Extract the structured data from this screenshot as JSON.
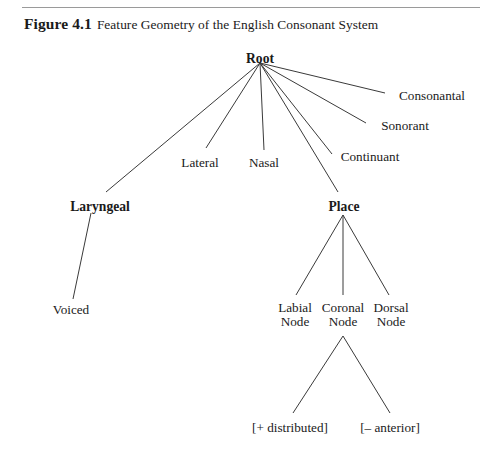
{
  "caption": {
    "figure_label": "Figure 4.1",
    "title": "Feature Geometry of the English Consonant System"
  },
  "chart_data": {
    "type": "diagram",
    "diagram_kind": "feature-geometry-tree",
    "title": "Feature Geometry of the English Consonant System",
    "root": "Root",
    "nodes": [
      {
        "id": "root",
        "label": "Root",
        "bold": true,
        "x": 260,
        "y": 52,
        "anchor_x": 260,
        "anchor_y": 63,
        "lines": [
          "Root"
        ]
      },
      {
        "id": "consonantal",
        "label": "Consonantal",
        "bold": false,
        "x": 432,
        "y": 89,
        "anchor_x": 385,
        "anchor_y": 93,
        "lines": [
          "Consonantal"
        ]
      },
      {
        "id": "sonorant",
        "label": "Sonorant",
        "bold": false,
        "x": 405,
        "y": 119,
        "anchor_x": 366,
        "anchor_y": 123,
        "lines": [
          "Sonorant"
        ]
      },
      {
        "id": "continuant",
        "label": "Continuant",
        "bold": false,
        "x": 370,
        "y": 150,
        "anchor_x": 332,
        "anchor_y": 154,
        "lines": [
          "Continuant"
        ]
      },
      {
        "id": "nasal",
        "label": "Nasal",
        "bold": false,
        "x": 264,
        "y": 156,
        "anchor_x": 264,
        "anchor_y": 150,
        "lines": [
          "Nasal"
        ]
      },
      {
        "id": "lateral",
        "label": "Lateral",
        "bold": false,
        "x": 200,
        "y": 156,
        "anchor_x": 204,
        "anchor_y": 150,
        "lines": [
          "Lateral"
        ]
      },
      {
        "id": "laryngeal",
        "label": "Laryngeal",
        "bold": true,
        "x": 100,
        "y": 200,
        "anchor_x": 106,
        "anchor_y": 194,
        "lines": [
          "Laryngeal"
        ]
      },
      {
        "id": "voiced",
        "label": "Voiced",
        "bold": false,
        "x": 71,
        "y": 303,
        "anchor_x": 74,
        "anchor_y": 299,
        "lines": [
          "Voiced"
        ]
      },
      {
        "id": "place",
        "label": "Place",
        "bold": true,
        "x": 344,
        "y": 200,
        "anchor_x": 340,
        "anchor_y": 194,
        "lines": [
          "Place"
        ]
      },
      {
        "id": "labial",
        "label": "Labial Node",
        "bold": false,
        "x": 295,
        "y": 301,
        "anchor_x": 297,
        "anchor_y": 297,
        "lines": [
          "Labial",
          "Node"
        ]
      },
      {
        "id": "coronal",
        "label": "Coronal Node",
        "bold": false,
        "x": 343,
        "y": 301,
        "anchor_x": 343,
        "anchor_y": 297,
        "lines": [
          "Coronal",
          "Node"
        ]
      },
      {
        "id": "dorsal",
        "label": "Dorsal Node",
        "bold": false,
        "x": 391,
        "y": 301,
        "anchor_x": 389,
        "anchor_y": 297,
        "lines": [
          "Dorsal",
          "Node"
        ]
      },
      {
        "id": "distributed",
        "label": "[+ distributed]",
        "bold": false,
        "x": 290,
        "y": 421,
        "anchor_x": 292,
        "anchor_y": 415,
        "lines": [
          "[+ distributed]"
        ]
      },
      {
        "id": "anterior",
        "label": "[– anterior]",
        "bold": false,
        "x": 390,
        "y": 421,
        "anchor_x": 389,
        "anchor_y": 415,
        "lines": [
          "[– anterior]"
        ]
      }
    ],
    "edges": [
      {
        "from": "root",
        "to": "consonantal",
        "x1": 260,
        "y1": 63,
        "x2": 385,
        "y2": 93
      },
      {
        "from": "root",
        "to": "sonorant",
        "x1": 260,
        "y1": 63,
        "x2": 366,
        "y2": 123
      },
      {
        "from": "root",
        "to": "continuant",
        "x1": 260,
        "y1": 63,
        "x2": 332,
        "y2": 154
      },
      {
        "from": "root",
        "to": "place",
        "x1": 260,
        "y1": 63,
        "x2": 338,
        "y2": 192
      },
      {
        "from": "root",
        "to": "nasal",
        "x1": 260,
        "y1": 63,
        "x2": 264,
        "y2": 150
      },
      {
        "from": "root",
        "to": "lateral",
        "x1": 260,
        "y1": 63,
        "x2": 206,
        "y2": 148
      },
      {
        "from": "root",
        "to": "laryngeal",
        "x1": 260,
        "y1": 63,
        "x2": 106,
        "y2": 192
      },
      {
        "from": "laryngeal",
        "to": "voiced",
        "x1": 91,
        "y1": 213,
        "x2": 73,
        "y2": 299
      },
      {
        "from": "place",
        "to": "labial",
        "x1": 343,
        "y1": 215,
        "x2": 296,
        "y2": 295
      },
      {
        "from": "place",
        "to": "coronal",
        "x1": 343,
        "y1": 215,
        "x2": 343,
        "y2": 295
      },
      {
        "from": "place",
        "to": "dorsal",
        "x1": 343,
        "y1": 215,
        "x2": 389,
        "y2": 295
      },
      {
        "from": "coronal",
        "to": "distributed",
        "x1": 343,
        "y1": 336,
        "x2": 293,
        "y2": 413
      },
      {
        "from": "coronal",
        "to": "anterior",
        "x1": 343,
        "y1": 336,
        "x2": 390,
        "y2": 413
      }
    ],
    "colors": {
      "background": "#ffffff",
      "line": "#3a3a3a",
      "text": "#1a1a1a",
      "rule": "#9a9a9a"
    }
  }
}
